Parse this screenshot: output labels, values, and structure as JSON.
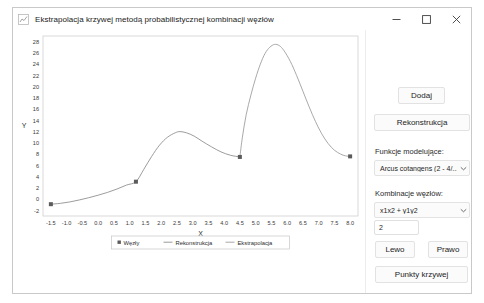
{
  "window": {
    "title": "Ekstrapolacja krzywej metodą probabilistycznej kombinacji węzłów",
    "app_icon": "chart-app-icon",
    "minimize_label": "—",
    "maximize_label": "□",
    "close_label": "✕"
  },
  "panel": {
    "dodaj_label": "Dodaj",
    "rekonstrukcja_label": "Rekonstrukcja",
    "funkcje_label": "Funkcje modelujące:",
    "funkcje_value": "Arcus cotangens (2 - 4/...",
    "kombinacje_label": "Kombinacje węzłów:",
    "kombinacje_value": "x1x2 + y1y2",
    "param_value": "2",
    "param_placeholder": "",
    "lewo_label": "Lewo",
    "prawo_label": "Prawo",
    "punkty_label": "Punkty krzywej"
  },
  "chart_data": {
    "type": "line",
    "title": "",
    "xlabel": "X",
    "ylabel": "Y",
    "xlim": [
      -1.75,
      8.25
    ],
    "ylim": [
      -3,
      29
    ],
    "xticks": [
      -1.5,
      -1.0,
      -0.5,
      0.0,
      0.5,
      1.0,
      1.5,
      2.0,
      2.5,
      3.0,
      3.5,
      4.0,
      4.5,
      5.0,
      5.5,
      6.0,
      6.5,
      7.0,
      7.5,
      8.0
    ],
    "xticklabels": [
      "-1.5",
      "-1.0",
      "-0.5",
      "0.0",
      "0.5",
      "1.0",
      "1.5",
      "2.0",
      "2.5",
      "3.0",
      "3.5",
      "4.0",
      "4.5",
      "5.0",
      "5.5",
      "6.0",
      "6.5",
      "7.0",
      "7.5",
      "8.0"
    ],
    "yticks": [
      -2,
      0,
      2,
      4,
      6,
      8,
      10,
      12,
      14,
      16,
      18,
      20,
      22,
      24,
      26,
      28
    ],
    "yticklabels": [
      "-2",
      "0",
      "2",
      "4",
      "6",
      "8",
      "10",
      "12",
      "14",
      "16",
      "18",
      "20",
      "22",
      "24",
      "26",
      "28"
    ],
    "grid": false,
    "legend_position": "bottom-center",
    "legend": [
      {
        "name": "Węzły",
        "marker": "square",
        "color": "#5b5b5b"
      },
      {
        "name": "Rekonstrukcja",
        "marker": "line",
        "color": "#8a8a8a"
      },
      {
        "name": "Ekstrapolacja",
        "marker": "line",
        "color": "#9a9a9a"
      }
    ],
    "series": [
      {
        "name": "Węzły",
        "type": "scatter",
        "color": "#5b5b5b",
        "points": [
          {
            "x": -1.5,
            "y": -0.9
          },
          {
            "x": 1.2,
            "y": 3.1
          },
          {
            "x": 4.5,
            "y": 7.5
          },
          {
            "x": 8.0,
            "y": 7.6
          }
        ]
      },
      {
        "name": "Rekonstrukcja",
        "type": "line",
        "color": "#8a8a8a",
        "points": [
          {
            "x": -1.5,
            "y": -0.9
          },
          {
            "x": -1.2,
            "y": -0.75
          },
          {
            "x": -0.9,
            "y": -0.5
          },
          {
            "x": -0.6,
            "y": -0.15
          },
          {
            "x": -0.3,
            "y": 0.25
          },
          {
            "x": 0.0,
            "y": 0.7
          },
          {
            "x": 0.3,
            "y": 1.2
          },
          {
            "x": 0.6,
            "y": 1.8
          },
          {
            "x": 0.9,
            "y": 2.5
          },
          {
            "x": 1.2,
            "y": 3.1
          },
          {
            "x": 1.45,
            "y": 5.3
          },
          {
            "x": 1.7,
            "y": 7.6
          },
          {
            "x": 1.95,
            "y": 9.6
          },
          {
            "x": 2.2,
            "y": 11.0
          },
          {
            "x": 2.45,
            "y": 11.8
          },
          {
            "x": 2.6,
            "y": 12.0
          },
          {
            "x": 2.8,
            "y": 11.8
          },
          {
            "x": 3.05,
            "y": 11.2
          },
          {
            "x": 3.3,
            "y": 10.3
          },
          {
            "x": 3.6,
            "y": 9.3
          },
          {
            "x": 3.9,
            "y": 8.4
          },
          {
            "x": 4.2,
            "y": 7.8
          },
          {
            "x": 4.5,
            "y": 7.5
          }
        ]
      },
      {
        "name": "Ekstrapolacja",
        "type": "line",
        "color": "#9a9a9a",
        "points": [
          {
            "x": 4.5,
            "y": 7.5
          },
          {
            "x": 4.58,
            "y": 11.0
          },
          {
            "x": 4.7,
            "y": 15.0
          },
          {
            "x": 4.85,
            "y": 18.5
          },
          {
            "x": 5.0,
            "y": 21.5
          },
          {
            "x": 5.15,
            "y": 24.0
          },
          {
            "x": 5.3,
            "y": 25.9
          },
          {
            "x": 5.45,
            "y": 27.0
          },
          {
            "x": 5.6,
            "y": 27.5
          },
          {
            "x": 5.75,
            "y": 27.3
          },
          {
            "x": 5.9,
            "y": 26.4
          },
          {
            "x": 6.1,
            "y": 24.5
          },
          {
            "x": 6.3,
            "y": 22.0
          },
          {
            "x": 6.5,
            "y": 19.2
          },
          {
            "x": 6.7,
            "y": 16.4
          },
          {
            "x": 6.9,
            "y": 13.8
          },
          {
            "x": 7.1,
            "y": 11.6
          },
          {
            "x": 7.3,
            "y": 9.9
          },
          {
            "x": 7.5,
            "y": 8.7
          },
          {
            "x": 7.7,
            "y": 8.0
          },
          {
            "x": 7.85,
            "y": 7.7
          },
          {
            "x": 8.0,
            "y": 7.6
          }
        ]
      }
    ]
  }
}
